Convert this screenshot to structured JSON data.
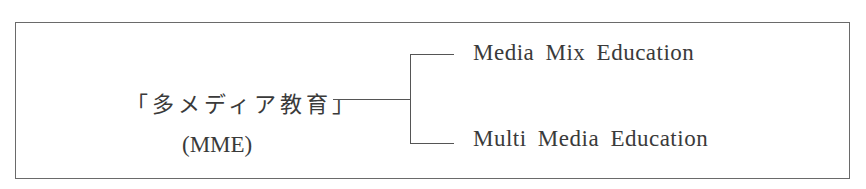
{
  "diagram": {
    "root": {
      "label": "「多メディア教育」",
      "abbreviation": "(MME)"
    },
    "branches": [
      {
        "label": "Media Mix Education"
      },
      {
        "label": "Multi Media Education"
      }
    ],
    "colors": {
      "line": "#555555",
      "text": "#3a3a3a",
      "border": "#6a6a6a"
    }
  }
}
